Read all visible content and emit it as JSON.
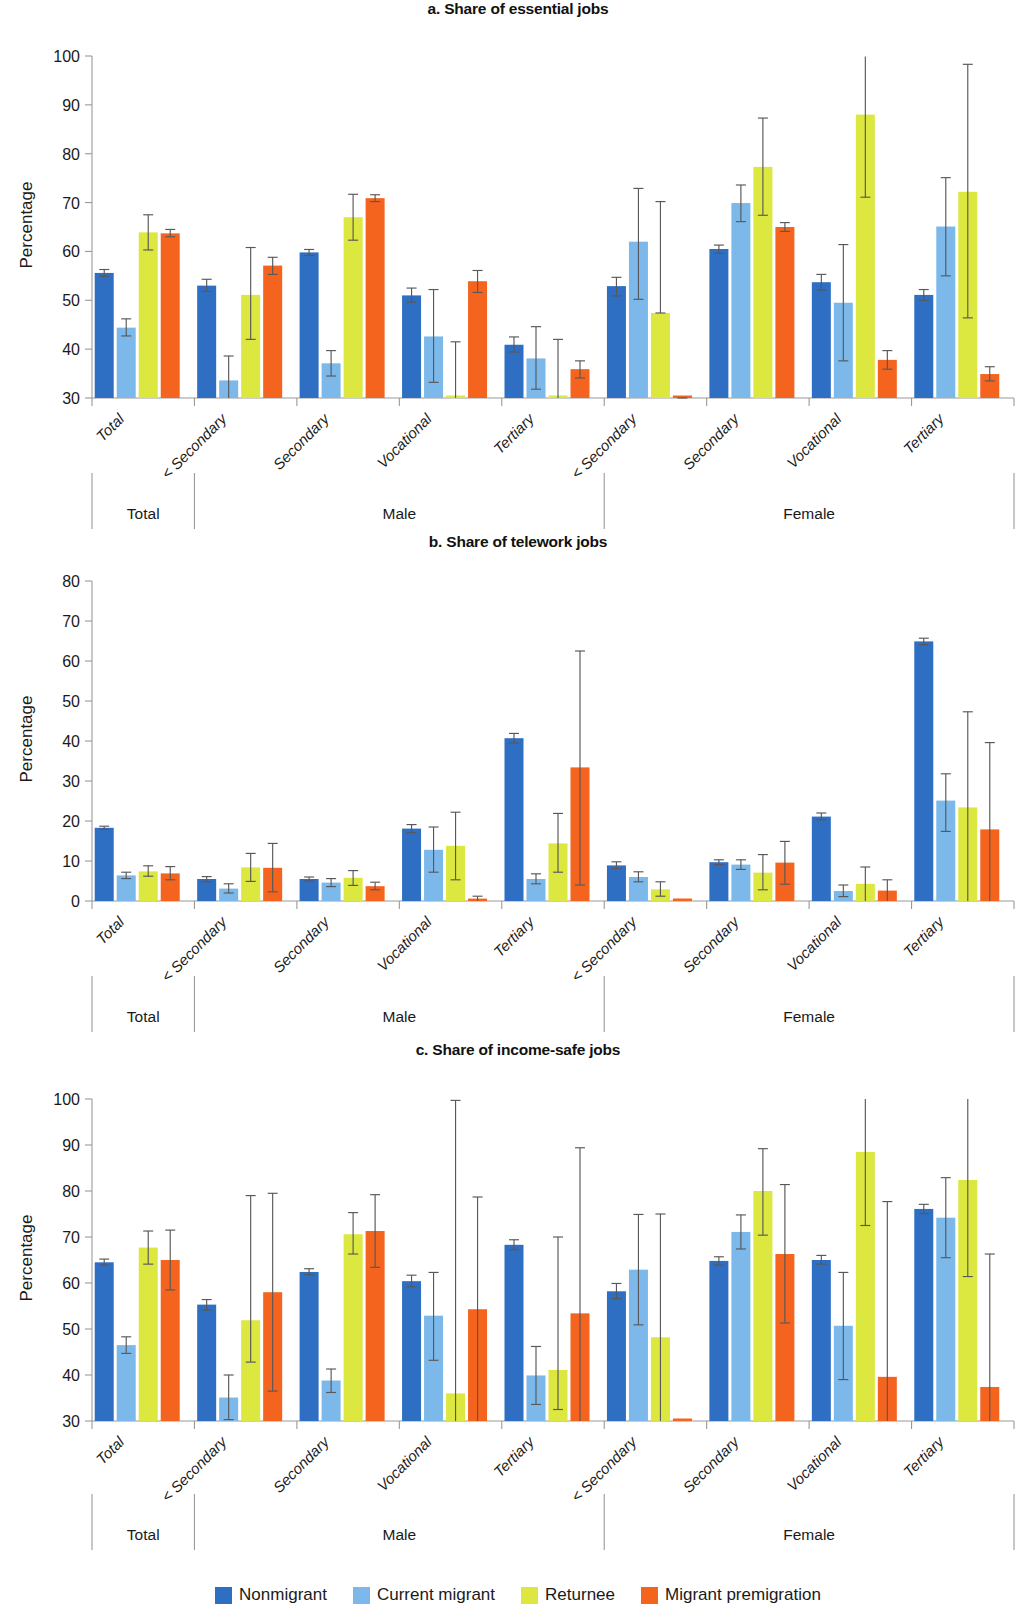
{
  "ylabel": "Percentage",
  "legend": {
    "items": [
      {
        "label": "Nonmigrant",
        "color": "#2E6FC3"
      },
      {
        "label": "Current migrant",
        "color": "#7CB9EA"
      },
      {
        "label": "Returnee",
        "color": "#DCE83F"
      },
      {
        "label": "Migrant premigration",
        "color": "#F4641E"
      }
    ]
  },
  "group_bands": [
    {
      "label": "Total"
    },
    {
      "label": "Male"
    },
    {
      "label": "Female"
    }
  ],
  "categories": [
    "Total",
    "< Secondary",
    "Secondary",
    "Vocational",
    "Tertiary",
    "< Secondary",
    "Secondary",
    "Vocational",
    "Tertiary"
  ],
  "chart_data": [
    {
      "type": "bar",
      "title": "a. Share of essential jobs",
      "xlabel": "",
      "ylabel": "Percentage",
      "ylim": [
        30,
        100
      ],
      "yticks": [
        30,
        40,
        50,
        60,
        70,
        80,
        90,
        100
      ],
      "grid": false,
      "legend_position": "bottom",
      "categories": [
        "Total",
        "< Secondary",
        "Secondary",
        "Vocational",
        "Tertiary",
        "< Secondary",
        "Secondary",
        "Vocational",
        "Tertiary"
      ],
      "group_bands": [
        "Total",
        "Male",
        "Male",
        "Male",
        "Male",
        "Female",
        "Female",
        "Female",
        "Female"
      ],
      "series": [
        {
          "name": "Nonmigrant",
          "values": [
            55.6,
            53.0,
            59.8,
            51.0,
            40.9,
            52.9,
            60.5,
            53.7,
            51.1
          ],
          "err_low": [
            54.9,
            51.8,
            59.2,
            49.6,
            39.4,
            50.9,
            59.6,
            52.1,
            50.0
          ],
          "err_high": [
            56.3,
            54.3,
            60.4,
            52.5,
            42.5,
            54.7,
            61.3,
            55.3,
            52.2
          ]
        },
        {
          "name": "Current migrant",
          "values": [
            44.4,
            33.6,
            37.1,
            42.6,
            38.1,
            62.0,
            69.9,
            49.5,
            65.1
          ],
          "err_low": [
            42.7,
            29.2,
            34.5,
            33.2,
            31.8,
            50.2,
            66.1,
            37.6,
            55.0
          ],
          "err_high": [
            46.2,
            38.6,
            39.7,
            52.2,
            44.6,
            72.9,
            73.6,
            61.4,
            75.1
          ]
        },
        {
          "name": "Returnee",
          "values": [
            63.9,
            51.1,
            67.0,
            29.7,
            29.6,
            47.4,
            77.3,
            88.0,
            72.2
          ],
          "err_low": [
            60.3,
            42.0,
            62.3,
            29.7,
            29.6,
            47.4,
            67.4,
            71.1,
            46.4
          ],
          "err_high": [
            67.5,
            60.8,
            71.7,
            41.5,
            42.0,
            70.2,
            87.3,
            99.9,
            98.3
          ]
        },
        {
          "name": "Migrant premigration",
          "values": [
            63.7,
            57.1,
            70.9,
            53.9,
            35.9,
            29.4,
            65.0,
            37.8,
            34.9
          ],
          "err_low": [
            63.0,
            55.3,
            70.2,
            51.6,
            34.1,
            29.4,
            64.1,
            35.9,
            33.5
          ],
          "err_high": [
            64.5,
            58.8,
            71.6,
            56.1,
            37.6,
            29.6,
            65.9,
            39.7,
            36.4
          ]
        }
      ]
    },
    {
      "type": "bar",
      "title": "b. Share of telework jobs",
      "xlabel": "",
      "ylabel": "Percentage",
      "ylim": [
        0,
        80
      ],
      "yticks": [
        0,
        10,
        20,
        30,
        40,
        50,
        60,
        70,
        80
      ],
      "grid": false,
      "legend_position": "bottom",
      "categories": [
        "Total",
        "< Secondary",
        "Secondary",
        "Vocational",
        "Tertiary",
        "< Secondary",
        "Secondary",
        "Vocational",
        "Tertiary"
      ],
      "group_bands": [
        "Total",
        "Male",
        "Male",
        "Male",
        "Male",
        "Female",
        "Female",
        "Female",
        "Female"
      ],
      "series": [
        {
          "name": "Nonmigrant",
          "values": [
            18.3,
            5.5,
            5.5,
            18.1,
            40.7,
            8.9,
            9.7,
            21.1,
            64.9
          ],
          "err_low": [
            17.9,
            4.8,
            5.0,
            17.1,
            39.5,
            8.1,
            9.1,
            20.3,
            64.1
          ],
          "err_high": [
            18.7,
            6.1,
            6.0,
            19.1,
            41.9,
            9.8,
            10.3,
            22.0,
            65.7
          ]
        },
        {
          "name": "Current migrant",
          "values": [
            6.4,
            3.1,
            4.6,
            12.8,
            5.5,
            6.0,
            9.1,
            2.5,
            25.1
          ],
          "err_low": [
            5.6,
            2.0,
            3.6,
            7.2,
            4.3,
            4.8,
            7.9,
            1.1,
            17.4
          ],
          "err_high": [
            7.2,
            4.3,
            5.6,
            18.5,
            6.8,
            7.3,
            10.3,
            4.0,
            31.8
          ]
        },
        {
          "name": "Returnee",
          "values": [
            7.4,
            8.4,
            5.8,
            13.8,
            14.4,
            2.9,
            7.1,
            4.3,
            23.4
          ],
          "err_low": [
            6.2,
            4.9,
            3.9,
            5.3,
            7.2,
            1.2,
            2.8,
            0.0,
            0.0
          ],
          "err_high": [
            8.8,
            11.9,
            7.6,
            22.2,
            21.9,
            4.8,
            11.6,
            8.5,
            47.3
          ]
        },
        {
          "name": "Migrant premigration",
          "values": [
            6.9,
            8.3,
            3.7,
            0.6,
            33.4,
            0.0,
            9.6,
            2.6,
            17.9
          ],
          "err_low": [
            5.3,
            2.3,
            2.8,
            0.0,
            4.0,
            0.0,
            4.2,
            0.0,
            0.0
          ],
          "err_high": [
            8.6,
            14.4,
            4.7,
            1.2,
            62.5,
            0.0,
            14.9,
            5.3,
            39.6
          ]
        }
      ]
    },
    {
      "type": "bar",
      "title": "c. Share of income-safe jobs",
      "xlabel": "",
      "ylabel": "Percentage",
      "ylim": [
        30,
        100
      ],
      "yticks": [
        30,
        40,
        50,
        60,
        70,
        80,
        90,
        100
      ],
      "grid": false,
      "legend_position": "bottom",
      "categories": [
        "Total",
        "< Secondary",
        "Secondary",
        "Vocational",
        "Tertiary",
        "< Secondary",
        "Secondary",
        "Vocational",
        "Tertiary"
      ],
      "group_bands": [
        "Total",
        "Male",
        "Male",
        "Male",
        "Male",
        "Female",
        "Female",
        "Female",
        "Female"
      ],
      "series": [
        {
          "name": "Nonmigrant",
          "values": [
            64.5,
            55.3,
            62.4,
            60.4,
            68.3,
            58.2,
            64.8,
            65.0,
            76.1
          ],
          "err_low": [
            63.9,
            54.1,
            61.8,
            59.2,
            67.2,
            56.6,
            63.9,
            64.1,
            75.1
          ],
          "err_high": [
            65.2,
            56.4,
            63.1,
            61.7,
            69.4,
            59.9,
            65.7,
            66.0,
            77.1
          ]
        },
        {
          "name": "Current migrant",
          "values": [
            46.5,
            35.1,
            38.8,
            52.9,
            39.9,
            62.9,
            71.1,
            50.7,
            74.2
          ],
          "err_low": [
            44.7,
            30.3,
            36.2,
            43.2,
            33.6,
            50.9,
            67.4,
            39.0,
            65.5
          ],
          "err_high": [
            48.3,
            40.0,
            41.3,
            62.3,
            46.2,
            74.9,
            74.8,
            62.3,
            82.9
          ]
        },
        {
          "name": "Returnee",
          "values": [
            67.7,
            51.9,
            70.6,
            36.0,
            41.1,
            48.2,
            80.0,
            88.5,
            82.4
          ],
          "err_low": [
            64.1,
            42.8,
            66.3,
            30.0,
            32.5,
            30.0,
            70.4,
            72.5,
            61.4
          ],
          "err_high": [
            71.3,
            79.0,
            75.3,
            99.7,
            70.0,
            75.0,
            89.2,
            103.5,
            101.9
          ]
        },
        {
          "name": "Migrant premigration",
          "values": [
            65.0,
            58.0,
            71.3,
            54.3,
            53.4,
            30.0,
            66.3,
            39.6,
            37.4
          ],
          "err_low": [
            58.5,
            36.5,
            63.4,
            30.0,
            30.0,
            30.0,
            51.3,
            30.0,
            30.0
          ],
          "err_high": [
            71.5,
            79.5,
            79.2,
            78.7,
            89.4,
            30.0,
            81.4,
            77.7,
            66.3
          ]
        }
      ]
    }
  ]
}
